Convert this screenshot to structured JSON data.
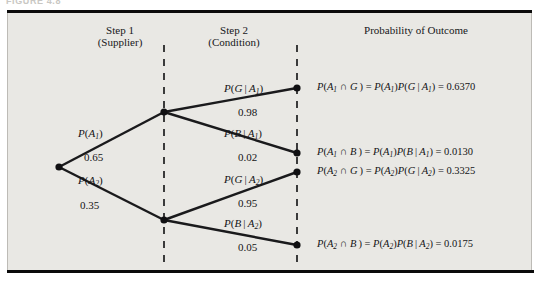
{
  "figure": {
    "caption_stub": "FIGURE 4.8"
  },
  "headers": {
    "step1": "Step 1\n(Supplier)",
    "step1_line1": "Step 1",
    "step1_line2": "(Supplier)",
    "step2_line1": "Step 2",
    "step2_line2": "(Condition)",
    "outcome": "Probability of Outcome"
  },
  "colors": {
    "background": "#e9e8e4",
    "page": "#ffffff",
    "rule": "#0b0b0b",
    "branch": "#1a1a1c",
    "node": "#101012",
    "dashed_guide": "#0f0f11",
    "text": "#141416"
  },
  "nodes": {
    "root": {
      "label": "root-node",
      "x": 59,
      "y": 167
    },
    "a1": {
      "label": "node-a1",
      "x": 164,
      "y": 112
    },
    "a2": {
      "label": "node-a2",
      "x": 164,
      "y": 220
    },
    "a1g": {
      "label": "node-a1-g",
      "x": 297,
      "y": 88
    },
    "a1b": {
      "label": "node-a1-b",
      "x": 297,
      "y": 153
    },
    "a2g": {
      "label": "node-a2-g",
      "x": 297,
      "y": 172
    },
    "a2b": {
      "label": "node-a2-b",
      "x": 297,
      "y": 245
    }
  },
  "guides": {
    "step1_x": 164,
    "step2_x": 297,
    "top_y": 45,
    "bottom_y": 268
  },
  "branches": {
    "step1": [
      {
        "name": "branch-a1",
        "prob_symbol_html": "<i>P</i>(<i>A</i><sub>1</sub>)",
        "prob_symbol_text": "P(A1)",
        "value": "0.65"
      },
      {
        "name": "branch-a2",
        "prob_symbol_html": "<i>P</i>(<i>A</i><sub>2</sub>)",
        "prob_symbol_text": "P(A2)",
        "value": "0.35"
      }
    ],
    "step2": [
      {
        "name": "branch-g-given-a1",
        "prob_symbol_html": "<i>P</i>(<i>G</i>&#8201;|&#8201;<i>A</i><sub>1</sub>)",
        "prob_symbol_text": "P(G | A1)",
        "value": "0.98"
      },
      {
        "name": "branch-b-given-a1",
        "prob_symbol_html": "<i>P</i>(<i>B</i>&#8201;|&#8201;<i>A</i><sub>1</sub>)",
        "prob_symbol_text": "P(B | A1)",
        "value": "0.02"
      },
      {
        "name": "branch-g-given-a2",
        "prob_symbol_html": "<i>P</i>(<i>G</i>&#8201;|&#8201;<i>A</i><sub>2</sub>)",
        "prob_symbol_text": "P(G | A2)",
        "value": "0.95"
      },
      {
        "name": "branch-b-given-a2",
        "prob_symbol_html": "<i>P</i>(<i>B</i>&#8201;|&#8201;<i>A</i><sub>2</sub>)",
        "prob_symbol_text": "P(B | A2)",
        "value": "0.05"
      }
    ]
  },
  "outcomes": [
    {
      "name": "outcome-a1-g",
      "html": "<i>P</i>(<i>A</i><sub>1</sub> &#8745; <i>G</i>&#8201;) = <i>P</i>(<i>A</i><sub>1</sub>)<i>P</i>(<i>G</i>&#8201;|&#8201;<i>A</i><sub>1</sub>) = 0.6370",
      "text": "P(A1 ∩ G) = P(A1)P(G | A1) = 0.6370",
      "value": "0.6370"
    },
    {
      "name": "outcome-a1-b",
      "html": "<i>P</i>(<i>A</i><sub>1</sub> &#8745; <i>B</i>&#8201;) = <i>P</i>(<i>A</i><sub>1</sub>)<i>P</i>(<i>B</i>&#8201;|&#8201;<i>A</i><sub>1</sub>) = 0.0130",
      "text": "P(A1 ∩ B) = P(A1)P(B | A1) = 0.0130",
      "value": "0.0130"
    },
    {
      "name": "outcome-a2-g",
      "html": "<i>P</i>(<i>A</i><sub>2</sub> &#8745; <i>G</i>&#8201;) = <i>P</i>(<i>A</i><sub>2</sub>)<i>P</i>(<i>G</i>&#8201;|&#8201;<i>A</i><sub>2</sub>) = 0.3325",
      "text": "P(A2 ∩ G) = P(A2)P(G | A2) = 0.3325",
      "value": "0.3325"
    },
    {
      "name": "outcome-a2-b",
      "html": "<i>P</i>(<i>A</i><sub>2</sub> &#8745; <i>B</i>&#8201;) = <i>P</i>(<i>A</i><sub>2</sub>)<i>P</i>(<i>B</i>&#8201;|&#8201;<i>A</i><sub>2</sub>) = 0.0175",
      "text": "P(A2 ∩ B) = P(A2)P(B | A2) = 0.0175",
      "value": "0.0175"
    }
  ],
  "chart_data": {
    "type": "diagram",
    "subtype": "probability-tree",
    "title": "Probability of Outcome",
    "stages": [
      "Step 1 (Supplier)",
      "Step 2 (Condition)"
    ],
    "root": "start",
    "edges": [
      {
        "from": "root",
        "to": "A1",
        "label": "P(A1)",
        "value": 0.65
      },
      {
        "from": "root",
        "to": "A2",
        "label": "P(A2)",
        "value": 0.35
      },
      {
        "from": "A1",
        "to": "A1G",
        "label": "P(G | A1)",
        "value": 0.98
      },
      {
        "from": "A1",
        "to": "A1B",
        "label": "P(B | A1)",
        "value": 0.02
      },
      {
        "from": "A2",
        "to": "A2G",
        "label": "P(G | A2)",
        "value": 0.95
      },
      {
        "from": "A2",
        "to": "A2B",
        "label": "P(B | A2)",
        "value": 0.05
      }
    ],
    "joint_probabilities": [
      {
        "outcome": "A1 ∩ G",
        "value": 0.637
      },
      {
        "outcome": "A1 ∩ B",
        "value": 0.013
      },
      {
        "outcome": "A2 ∩ G",
        "value": 0.3325
      },
      {
        "outcome": "A2 ∩ B",
        "value": 0.0175
      }
    ]
  }
}
